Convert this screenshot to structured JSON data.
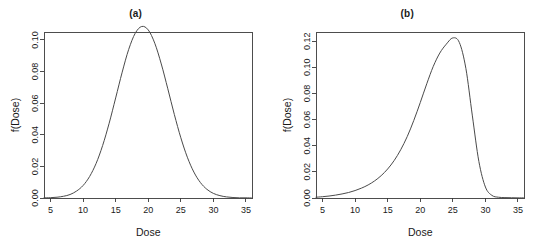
{
  "figure": {
    "background_color": "#ffffff",
    "line_color": "#4a4a4a",
    "axis_color": "#3a3a3a"
  },
  "chart_data": [
    {
      "type": "line",
      "title": "(a)",
      "xlabel": "Dose",
      "ylabel": "f(Dose)",
      "xlim": [
        4.0,
        36.0
      ],
      "ylim": [
        0.0,
        0.105
      ],
      "xticks": [
        5,
        10,
        15,
        20,
        25,
        30,
        35
      ],
      "xticklabels": [
        "5",
        "10",
        "15",
        "20",
        "25",
        "30",
        "35"
      ],
      "yticks": [
        0.0,
        0.02,
        0.04,
        0.06,
        0.08,
        0.1
      ],
      "yticklabels": [
        "0.00",
        "0.02",
        "0.04",
        "0.06",
        "0.08",
        "0.10"
      ],
      "grid": false,
      "legend": "none",
      "distribution": "symmetric normal density",
      "mode": 20,
      "peak_value": 0.0997,
      "x": [
        4.0,
        5.0,
        6.0,
        7.0,
        8.0,
        9.0,
        10.0,
        11.0,
        12.0,
        13.0,
        14.0,
        15.0,
        16.0,
        17.0,
        18.0,
        19.0,
        20.0,
        21.0,
        22.0,
        23.0,
        24.0,
        25.0,
        26.0,
        27.0,
        28.0,
        29.0,
        30.0,
        31.0,
        32.0,
        33.0,
        34.0,
        35.0,
        36.0
      ],
      "values": [
        0.0001,
        0.0002,
        0.0005,
        0.0011,
        0.0022,
        0.0044,
        0.0079,
        0.0136,
        0.0219,
        0.0332,
        0.0473,
        0.0633,
        0.0796,
        0.094,
        0.1042,
        0.1085,
        0.1063,
        0.0979,
        0.0848,
        0.0691,
        0.0529,
        0.0381,
        0.0258,
        0.0164,
        0.0098,
        0.0055,
        0.0029,
        0.0015,
        0.0007,
        0.0003,
        0.0001,
        0.0001,
        0.0
      ]
    },
    {
      "type": "line",
      "title": "(b)",
      "xlabel": "Dose",
      "ylabel": "f(Dose)",
      "xlim": [
        4.0,
        36.0
      ],
      "ylim": [
        0.0,
        0.127
      ],
      "xticks": [
        5,
        10,
        15,
        20,
        25,
        30,
        35
      ],
      "xticklabels": [
        "5",
        "10",
        "15",
        "20",
        "25",
        "30",
        "35"
      ],
      "yticks": [
        0.0,
        0.02,
        0.04,
        0.06,
        0.08,
        0.1,
        0.12
      ],
      "yticklabels": [
        "0.00",
        "0.02",
        "0.04",
        "0.06",
        "0.08",
        "0.10",
        "0.12"
      ],
      "grid": false,
      "legend": "none",
      "distribution": "negatively skewed density",
      "mode": 25,
      "peak_value": 0.1232,
      "x": [
        4.0,
        5.0,
        6.0,
        7.0,
        8.0,
        9.0,
        10.0,
        11.0,
        12.0,
        13.0,
        14.0,
        15.0,
        16.0,
        17.0,
        18.0,
        19.0,
        20.0,
        21.0,
        22.0,
        23.0,
        24.0,
        25.0,
        26.0,
        27.0,
        28.0,
        29.0,
        30.0,
        31.0,
        32.0,
        33.0,
        34.0,
        35.0,
        36.0
      ],
      "values": [
        0.0006,
        0.001,
        0.0015,
        0.0022,
        0.0031,
        0.0042,
        0.0057,
        0.0076,
        0.01,
        0.0131,
        0.0171,
        0.0222,
        0.0287,
        0.0369,
        0.047,
        0.0592,
        0.073,
        0.0874,
        0.1007,
        0.1109,
        0.1177,
        0.1225,
        0.119,
        0.0992,
        0.0628,
        0.0279,
        0.0084,
        0.002,
        0.0006,
        0.0003,
        0.0002,
        0.0001,
        0.0001
      ]
    }
  ]
}
